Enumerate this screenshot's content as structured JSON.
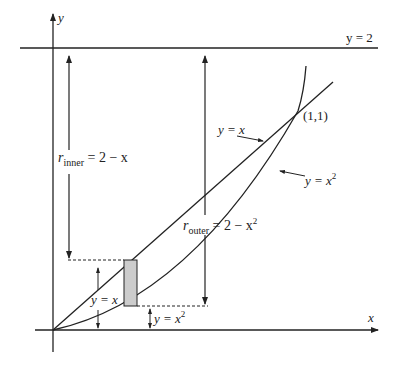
{
  "figure": {
    "axis_x_label": "x",
    "axis_y_label": "y",
    "line_top_label": "y = 2",
    "intersection_label": "(1,1)",
    "line_label": "y = x",
    "curve_label_base": "y = x",
    "curve_label_exp": "2",
    "r_inner": {
      "r": "r",
      "sub": "inner",
      "rest": " = 2 − x"
    },
    "r_outer": {
      "r": "r",
      "sub": "outer",
      "rest": " = 2 − x",
      "exp": "2"
    },
    "height_upper_label": "y = x",
    "height_lower_base": "y = x",
    "height_lower_exp": "2",
    "colors": {
      "ink": "#222222",
      "strip_fill": "#cccccc"
    }
  }
}
